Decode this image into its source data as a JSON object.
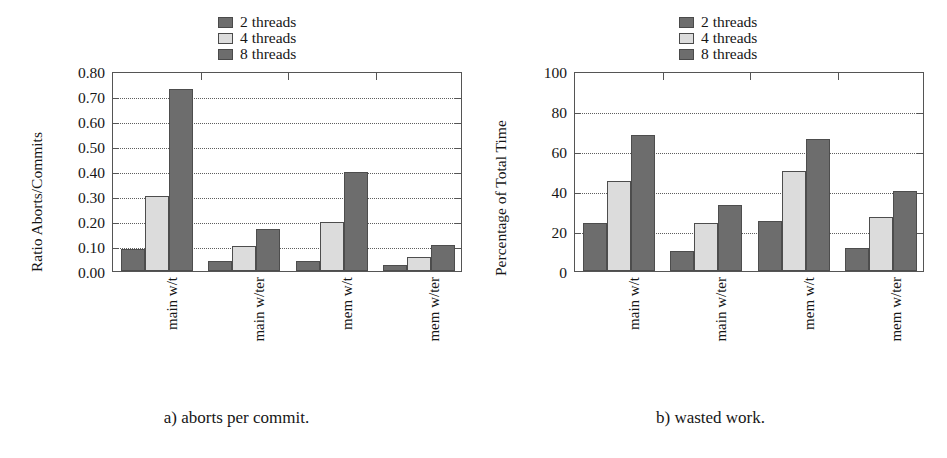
{
  "figure": {
    "panels": [
      {
        "id": "panel-a",
        "caption": "a) aborts per commit.",
        "legend": [
          {
            "label": "2 threads",
            "color": "#6d6d6d"
          },
          {
            "label": "4 threads",
            "color": "#dcdcdc"
          },
          {
            "label": "8 threads",
            "color": "#6d6d6d"
          }
        ],
        "chart_data": {
          "type": "bar",
          "title": "",
          "xlabel": "",
          "ylabel": "Ratio Aborts/Commits",
          "categories": [
            "main w/t",
            "main w/ter",
            "mem w/t",
            "mem w/ter"
          ],
          "series": [
            {
              "name": "2 threads",
              "color": "#6d6d6d",
              "values": [
                0.09,
                0.04,
                0.04,
                0.025
              ]
            },
            {
              "name": "4 threads",
              "color": "#dcdcdc",
              "values": [
                0.3,
                0.1,
                0.195,
                0.055
              ]
            },
            {
              "name": "8 threads",
              "color": "#6d6d6d",
              "values": [
                0.73,
                0.17,
                0.395,
                0.105
              ]
            }
          ],
          "ylim": [
            0.0,
            0.8
          ],
          "yticks": [
            0.0,
            0.1,
            0.2,
            0.3,
            0.4,
            0.5,
            0.6,
            0.7,
            0.8
          ],
          "ytick_labels": [
            "0.00",
            "0.10",
            "0.20",
            "0.30",
            "0.40",
            "0.50",
            "0.60",
            "0.70",
            "0.80"
          ],
          "grid": true,
          "legend_position": "top-center"
        }
      },
      {
        "id": "panel-b",
        "caption": "b) wasted work.",
        "legend": [
          {
            "label": "2 threads",
            "color": "#6d6d6d"
          },
          {
            "label": "4 threads",
            "color": "#dcdcdc"
          },
          {
            "label": "8 threads",
            "color": "#6d6d6d"
          }
        ],
        "chart_data": {
          "type": "bar",
          "title": "",
          "xlabel": "",
          "ylabel": "Percentage of Total Time",
          "categories": [
            "main w/t",
            "main w/ter",
            "mem w/t",
            "mem w/ter"
          ],
          "series": [
            {
              "name": "2 threads",
              "color": "#6d6d6d",
              "values": [
                24,
                10,
                25,
                11.5
              ]
            },
            {
              "name": "4 threads",
              "color": "#dcdcdc",
              "values": [
                45,
                24,
                50,
                27
              ]
            },
            {
              "name": "8 threads",
              "color": "#6d6d6d",
              "values": [
                68,
                33,
                66,
                40
              ]
            }
          ],
          "ylim": [
            0,
            100
          ],
          "yticks": [
            0,
            20,
            40,
            60,
            80,
            100
          ],
          "ytick_labels": [
            "0",
            "20",
            "40",
            "60",
            "80",
            "100"
          ],
          "grid": true,
          "legend_position": "top-center"
        }
      }
    ]
  }
}
